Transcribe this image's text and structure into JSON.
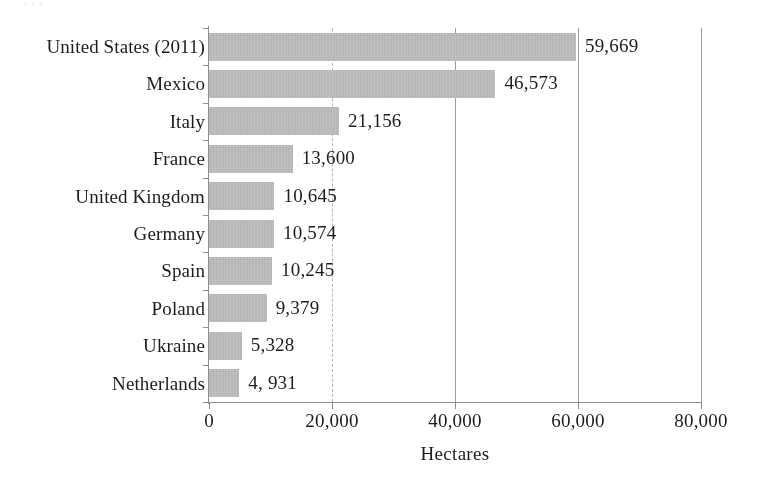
{
  "figure": {
    "clipped_text_above": ", ,   ,",
    "axis_title": "Hectares"
  },
  "chart_data": {
    "type": "bar",
    "orientation": "horizontal",
    "title": "",
    "xlabel": "Hectares",
    "ylabel": "",
    "xlim": [
      0,
      80000
    ],
    "xticks": [
      0,
      20000,
      40000,
      60000,
      80000
    ],
    "xtick_labels": [
      "0",
      "20,000",
      "40,000",
      "60,000",
      "80,000"
    ],
    "grid": "vertical",
    "legend": "none",
    "bar_color": "#c2c2c2",
    "categories": [
      "United States (2011)",
      "Mexico",
      "Italy",
      "France",
      "United Kingdom",
      "Germany",
      "Spain",
      "Poland",
      "Ukraine",
      "Netherlands"
    ],
    "values": [
      59669,
      46573,
      21156,
      13600,
      10645,
      10574,
      10245,
      9379,
      5328,
      4931
    ],
    "value_labels": [
      "59,669",
      "46,573",
      "21,156",
      "13,600",
      "10,645",
      "10,574",
      "10,245",
      "9,379",
      "5,328",
      "4, 931"
    ]
  }
}
